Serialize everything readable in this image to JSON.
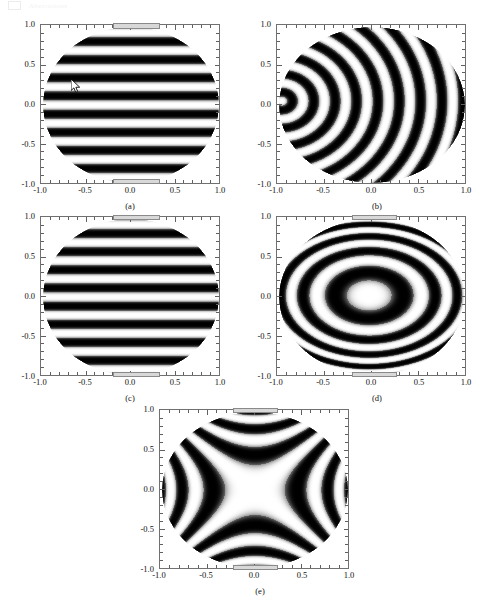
{
  "page_header": {
    "box_icon": "page-marker-icon",
    "text": "Aberrations"
  },
  "figure": {
    "panels": [
      {
        "id": "a",
        "caption": "(a)",
        "pattern": "horizontal-bands",
        "cursor_visible": true
      },
      {
        "id": "b",
        "caption": "(b)",
        "pattern": "coma-arcs",
        "cursor_visible": false
      },
      {
        "id": "c",
        "caption": "(c)",
        "pattern": "horizontal-bands",
        "cursor_visible": false
      },
      {
        "id": "d",
        "caption": "(d)",
        "pattern": "concentric-ellipses",
        "cursor_visible": false
      },
      {
        "id": "e",
        "caption": "(e)",
        "pattern": "astigmatism-saddle",
        "cursor_visible": false
      }
    ],
    "axis": {
      "x_ticks": [
        "-1.0",
        "-0.5",
        "0.0",
        "0.5",
        "1.0"
      ],
      "y_ticks": [
        "1.0",
        "0.5",
        "0.0",
        "-0.5",
        "-1.0"
      ],
      "x_values": [
        -1.0,
        -0.5,
        0.0,
        0.5,
        1.0
      ],
      "y_values": [
        1.0,
        0.5,
        0.0,
        -0.5,
        -1.0
      ],
      "xlim": [
        -1.0,
        1.0
      ],
      "ylim": [
        -1.0,
        1.0
      ]
    }
  },
  "chart_data": {
    "type": "heatmap",
    "title": "",
    "xlabel": "",
    "ylabel": "",
    "xlim": [
      -1.0,
      1.0
    ],
    "ylim": [
      -1.0,
      1.0
    ],
    "grid": false,
    "legend": "none",
    "colormap": "grayscale",
    "subplots": [
      {
        "label": "(a)",
        "description": "Horizontal fringe bands across unit disc; cosine of vertical coordinate only",
        "fringe_orientation": "horizontal",
        "num_dark_bands": 9,
        "band_centers_y": [
          0.93,
          0.78,
          0.63,
          0.4,
          -0.38,
          -0.62,
          -0.78,
          -0.92
        ],
        "symmetry": "mirror about y=0",
        "cursor_position": [
          -0.44,
          0.22
        ]
      },
      {
        "label": "(b)",
        "description": "Nested circular arcs opening rightwards, centered near x=-1",
        "fringe_orientation": "arcs",
        "arc_center": [
          -0.97,
          0.05
        ],
        "num_arcs": 17,
        "symmetry": "mirror about y=0"
      },
      {
        "label": "(c)",
        "description": "Horizontal fringe bands, same family as (a) without cursor",
        "fringe_orientation": "horizontal",
        "num_dark_bands": 9,
        "band_centers_y": [
          0.95,
          0.81,
          0.66,
          0.45,
          -0.42,
          -0.66,
          -0.81,
          -0.94
        ],
        "symmetry": "mirror about y=0"
      },
      {
        "label": "(d)",
        "description": "Concentric elliptical rings about origin, bright core",
        "fringe_orientation": "elliptical-rings",
        "ring_center": [
          -0.03,
          0.02
        ],
        "num_rings": 8,
        "core": "bright"
      },
      {
        "label": "(e)",
        "description": "Saddle / astigmatic pattern; bright cross through origin with four dark lobes",
        "fringe_orientation": "saddle",
        "num_lobes": 4,
        "core": "bright"
      }
    ]
  }
}
